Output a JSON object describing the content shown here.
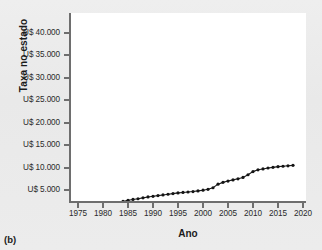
{
  "figure": {
    "panel_label": "(b)",
    "background_color": "#ececec",
    "plot_background_color": "#ffffff",
    "axis_color": "#6e6e6e",
    "series_color": "#141414"
  },
  "chart_data": {
    "type": "line",
    "title": "",
    "subtitle": "",
    "xlabel": "Ano",
    "ylabel": "Taxa no estado",
    "xlim": [
      1975,
      2020
    ],
    "ylim": [
      0,
      42000
    ],
    "grid": false,
    "legend": [],
    "legend_position": "none",
    "marker": "filled-circle",
    "xticks": [
      1975,
      1980,
      1985,
      1990,
      1995,
      2000,
      2005,
      2010,
      2015,
      2020
    ],
    "xticklabels": [
      "1975",
      "1980",
      "1985",
      "1990",
      "1995",
      "2000",
      "2005",
      "2010",
      "2015",
      "2020"
    ],
    "yticks": [
      5000,
      10000,
      15000,
      20000,
      25000,
      30000,
      35000,
      40000
    ],
    "yticklabels": [
      "U$ 5.000",
      "U$ 10.000",
      "U$ 15.000",
      "U$ 20.000",
      "U$ 25.000",
      "U$ 30.000",
      "U$ 35.000",
      "U$ 40.000"
    ],
    "x": [
      1980,
      1981,
      1982,
      1983,
      1984,
      1985,
      1986,
      1987,
      1988,
      1989,
      1990,
      1991,
      1992,
      1993,
      1994,
      1995,
      1996,
      1997,
      1998,
      1999,
      2000,
      2001,
      2002,
      2003,
      2004,
      2005,
      2006,
      2007,
      2008,
      2009,
      2010,
      2011,
      2012,
      2013,
      2014,
      2015,
      2016,
      2017,
      2018
    ],
    "values": [
      1800,
      1850,
      2000,
      2200,
      2450,
      2700,
      2900,
      3050,
      3250,
      3450,
      3600,
      3750,
      3900,
      4050,
      4200,
      4350,
      4450,
      4550,
      4650,
      4800,
      4950,
      5150,
      5500,
      6300,
      6700,
      7000,
      7250,
      7500,
      7800,
      8400,
      9100,
      9500,
      9700,
      9900,
      10050,
      10200,
      10300,
      10400,
      10500
    ],
    "annotations": []
  }
}
